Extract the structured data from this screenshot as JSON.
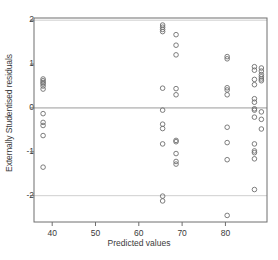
{
  "chart_data": {
    "type": "scatter",
    "title": "",
    "xlabel": "Predicted values",
    "ylabel": "Externally Studentised residuals",
    "xlim": [
      35.8,
      89.6
    ],
    "ylim": [
      -2.6,
      2.05
    ],
    "xticks": [
      40,
      50,
      60,
      70,
      80
    ],
    "xticklabels": [
      "40",
      "50",
      "60",
      "70",
      "80"
    ],
    "yticks": [
      2,
      1,
      0,
      -1,
      -2
    ],
    "yticklabels": [
      "2",
      "1",
      "0",
      "-1",
      "-2"
    ],
    "grid": false,
    "legend": null,
    "reference_lines": [
      {
        "name": "zero-line",
        "orientation": "horizontal",
        "y": 0,
        "color": "#9a9a9a"
      },
      {
        "name": "upper-bound-line",
        "orientation": "horizontal",
        "y": 2,
        "color": "#cfcfcf"
      },
      {
        "name": "lower-bound-line",
        "orientation": "horizontal",
        "y": -2,
        "color": "#cfcfcf"
      }
    ],
    "marker": {
      "shape": "circle-open",
      "radius_px": 2.3,
      "edge_color": "#6e6e6e",
      "face_color": "none"
    },
    "series": [
      {
        "name": "residuals",
        "points": [
          [
            37.9,
            0.66
          ],
          [
            37.9,
            0.62
          ],
          [
            37.9,
            0.58
          ],
          [
            37.9,
            0.55
          ],
          [
            37.9,
            0.5
          ],
          [
            37.9,
            0.43
          ],
          [
            37.9,
            -0.13
          ],
          [
            37.9,
            -0.33
          ],
          [
            37.9,
            -0.4
          ],
          [
            37.9,
            -0.63
          ],
          [
            37.9,
            -1.35
          ],
          [
            65.5,
            1.89
          ],
          [
            65.5,
            1.84
          ],
          [
            65.5,
            1.79
          ],
          [
            65.5,
            1.74
          ],
          [
            65.5,
            0.45
          ],
          [
            65.5,
            -0.05
          ],
          [
            65.5,
            -0.37
          ],
          [
            65.5,
            -0.47
          ],
          [
            65.5,
            -0.82
          ],
          [
            65.5,
            -2.01
          ],
          [
            65.5,
            -2.12
          ],
          [
            68.6,
            1.67
          ],
          [
            68.6,
            1.43
          ],
          [
            68.6,
            1.21
          ],
          [
            68.6,
            0.44
          ],
          [
            68.6,
            0.3
          ],
          [
            68.6,
            -0.74
          ],
          [
            68.6,
            -0.77
          ],
          [
            68.6,
            -1.04
          ],
          [
            68.6,
            -1.22
          ],
          [
            68.6,
            -1.28
          ],
          [
            80.4,
            1.17
          ],
          [
            80.4,
            1.12
          ],
          [
            80.4,
            0.46
          ],
          [
            80.4,
            0.41
          ],
          [
            80.4,
            0.3
          ],
          [
            80.4,
            -0.44
          ],
          [
            80.4,
            -0.79
          ],
          [
            80.4,
            -1.18
          ],
          [
            80.4,
            -2.45
          ],
          [
            86.7,
            0.94
          ],
          [
            86.7,
            0.86
          ],
          [
            86.7,
            0.65
          ],
          [
            86.7,
            0.53
          ],
          [
            86.7,
            0.21
          ],
          [
            86.7,
            0.13
          ],
          [
            86.7,
            -0.02
          ],
          [
            86.7,
            -0.05
          ],
          [
            86.7,
            -0.21
          ],
          [
            86.7,
            -0.82
          ],
          [
            86.7,
            -0.98
          ],
          [
            86.7,
            -1.02
          ],
          [
            86.7,
            -1.16
          ],
          [
            86.7,
            -1.86
          ],
          [
            88.3,
            0.91
          ],
          [
            88.3,
            0.84
          ],
          [
            88.3,
            0.76
          ],
          [
            88.3,
            0.71
          ],
          [
            88.3,
            0.66
          ],
          [
            88.3,
            0.62
          ],
          [
            88.3,
            -0.09
          ],
          [
            88.3,
            -0.26
          ],
          [
            88.3,
            -0.48
          ]
        ]
      }
    ]
  },
  "axes": {
    "frame_color": "#6e6e6e",
    "tick_color": "#6e6e6e",
    "text_color": "#3a3a3a"
  }
}
